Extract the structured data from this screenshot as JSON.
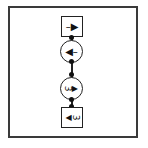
{
  "diagram": {
    "nodes": [
      {
        "id": "n1",
        "shape": "square",
        "symbol": "1",
        "arrow": "right",
        "label": "–▶"
      },
      {
        "id": "n2",
        "shape": "circle",
        "symbol": "1",
        "arrow": "left",
        "label": "◀–"
      },
      {
        "id": "n3",
        "shape": "circle",
        "symbol": "3",
        "arrow": "right",
        "label": "▶",
        "digit": "3"
      },
      {
        "id": "n4",
        "shape": "square",
        "symbol": "3",
        "arrow": "left",
        "label": "◀",
        "digit": "3"
      }
    ],
    "edges": [
      {
        "from": "n1",
        "to": "n2"
      },
      {
        "from": "n2",
        "to": "n3"
      },
      {
        "from": "n3",
        "to": "n4"
      }
    ],
    "colors": {
      "stroke": "#222222",
      "frame": "#3a3a3a",
      "background": "#ffffff"
    }
  }
}
